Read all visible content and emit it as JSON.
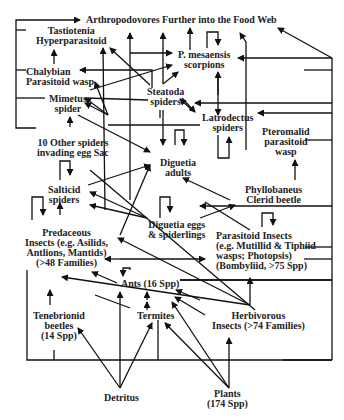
{
  "diagram": {
    "type": "food-web",
    "nodes": {
      "top": "Arthropodovores Further into the Food Web",
      "tastiotenia": [
        "Tastiotenia",
        "Hyperparasitoid"
      ],
      "chalybian": [
        "Chalybian",
        "Parasitoid wasp"
      ],
      "mimetus": [
        "Mimetus",
        "spider"
      ],
      "scorpions": [
        "P. mesaensis",
        "scorpions"
      ],
      "steatoda": [
        "Steatoda",
        "spiders"
      ],
      "latrodectus": [
        "Latrodectus",
        "spiders"
      ],
      "other_spiders": [
        "10 Other spiders",
        "invading egg Sac"
      ],
      "pteromalid": [
        "Pteromalid",
        "parasitoid",
        "wasp"
      ],
      "diguetia_adults": [
        "Diguetia",
        "adults"
      ],
      "salticid": [
        "Salticid",
        "spiders"
      ],
      "phyllobaneus": [
        "Phyllobaneus",
        "Clerid beetle"
      ],
      "diguetia_eggs": [
        "Diguetia eggs",
        "& spiderlings"
      ],
      "predaceous": [
        "Predaceous",
        "Insects (e.g. Asilids,",
        "Antlions, Mantids)",
        "(>48 Families)"
      ],
      "parasitoid_insects": [
        "Parasitoid Insects",
        "(e.g. Mutillid & Tiphiid",
        "wasps; Photopsis)",
        "(Bombyliid, >75 Spp)"
      ],
      "ants": "Ants (16 Spp)",
      "tenebrionid": [
        "Tenebrionid",
        "beetles",
        "(14 Spp)"
      ],
      "termites": "Termites",
      "herbivorous": [
        "Herbivorous",
        "Insects (>74 Families)"
      ],
      "detritus": "Detritus",
      "plants": [
        "Plants",
        "(174 Spp)"
      ]
    }
  }
}
